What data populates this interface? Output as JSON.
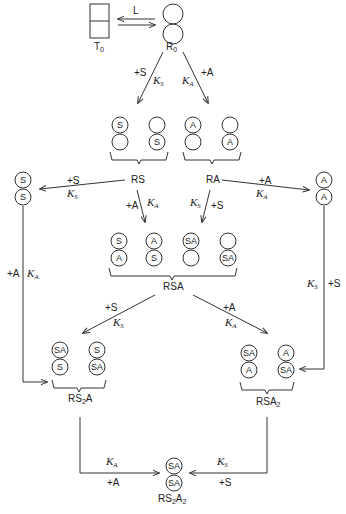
{
  "diagram": {
    "states": {
      "T0": {
        "label": "T",
        "sub": "0"
      },
      "R0": {
        "label": "R",
        "sub": "0"
      },
      "RS": {
        "label": "RS"
      },
      "RA": {
        "label": "RA"
      },
      "S2": {
        "label": ""
      },
      "A2": {
        "label": ""
      },
      "RSA": {
        "label": "RSA"
      },
      "RS2A": {
        "label_parts": [
          "RS",
          "2",
          "A"
        ]
      },
      "RSA2": {
        "label_parts": [
          "RSA",
          "2"
        ]
      },
      "RS2A2": {
        "label_parts": [
          "RS",
          "2",
          "A",
          "2"
        ]
      }
    },
    "transitions": {
      "T0_R0": {
        "label": "L"
      },
      "R0_RS": {
        "ligand": "+S",
        "constant": "K",
        "constant_sub": "S"
      },
      "R0_RA": {
        "ligand": "+A",
        "constant": "K",
        "constant_sub": "A"
      },
      "RS_S2": {
        "ligand": "+S",
        "constant": "K",
        "constant_sub": "S"
      },
      "RA_A2": {
        "ligand": "+A",
        "constant": "K",
        "constant_sub": "A"
      },
      "RS_RSA": {
        "ligand": "+A",
        "constant": "K",
        "constant_sub": "A"
      },
      "RA_RSA": {
        "ligand": "+S",
        "constant": "K",
        "constant_sub": "S"
      },
      "S2_RS2A": {
        "ligand": "+A",
        "constant": "K",
        "constant_sub": "A"
      },
      "A2_RSA2": {
        "ligand": "+S",
        "constant": "K",
        "constant_sub": "S"
      },
      "RSA_RS2A": {
        "ligand": "+S",
        "constant": "K",
        "constant_sub": "S"
      },
      "RSA_RSA2": {
        "ligand": "+A",
        "constant": "K",
        "constant_sub": "A"
      },
      "RS2A_RS2A2": {
        "ligand": "+A",
        "constant": "K",
        "constant_sub": "A"
      },
      "RSA2_RS2A2": {
        "ligand": "+S",
        "constant": "K",
        "constant_sub": "S"
      }
    },
    "subunits": {
      "RS_forms": [
        [
          "S",
          ""
        ],
        [
          "",
          "S"
        ]
      ],
      "RA_forms": [
        [
          "A",
          ""
        ],
        [
          "",
          "A"
        ]
      ],
      "S2_form": [
        "S",
        "S"
      ],
      "A2_form": [
        "A",
        "A"
      ],
      "RSA_forms": [
        [
          "S",
          "A"
        ],
        [
          "A",
          "S"
        ],
        [
          "SA",
          ""
        ],
        [
          "",
          "SA"
        ]
      ],
      "RS2A_forms": [
        [
          "SA",
          "S"
        ],
        [
          "S",
          "SA"
        ]
      ],
      "RSA2_forms": [
        [
          "SA",
          "A"
        ],
        [
          "A",
          "SA"
        ]
      ],
      "RS2A2_form": [
        "SA",
        "SA"
      ],
      "R0_form": [
        "",
        ""
      ]
    }
  }
}
